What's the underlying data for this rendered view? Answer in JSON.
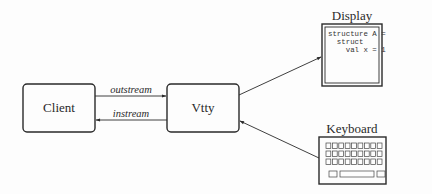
{
  "diagram": {
    "nodes": {
      "client": {
        "label": "Client"
      },
      "vtty": {
        "label": "Vtty"
      },
      "display": {
        "label": "Display",
        "screen_lines": [
          "structure A =",
          "  struct",
          "    val x = 1"
        ]
      },
      "keyboard": {
        "label": "Keyboard",
        "key_rows": 3,
        "keys_per_row": 9
      }
    },
    "edges": [
      {
        "from": "Client",
        "to": "Vtty",
        "label": "outstream"
      },
      {
        "from": "Vtty",
        "to": "Client",
        "label": "instream"
      },
      {
        "from": "Vtty",
        "to": "Display",
        "label": ""
      },
      {
        "from": "Keyboard",
        "to": "Vtty",
        "label": ""
      }
    ],
    "colors": {
      "stroke": "#2a2a2a",
      "background": "#fdfdfd"
    }
  }
}
